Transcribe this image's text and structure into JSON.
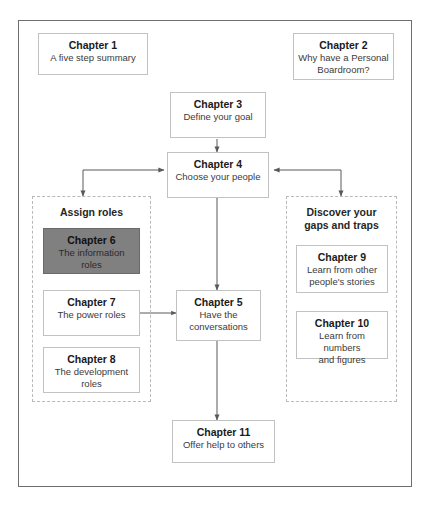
{
  "diagram": {
    "title_artifact": "",
    "groups": [
      {
        "id": "assign-roles",
        "label": "Assign roles"
      },
      {
        "id": "discover-gaps",
        "label": "Discover your\ngaps and traps"
      }
    ],
    "nodes": [
      {
        "id": "ch1",
        "title": "Chapter 1",
        "subtitle": "A five step summary"
      },
      {
        "id": "ch2",
        "title": "Chapter 2",
        "subtitle": "Why have a Personal Boardroom?"
      },
      {
        "id": "ch3",
        "title": "Chapter 3",
        "subtitle": "Define your goal"
      },
      {
        "id": "ch4",
        "title": "Chapter 4",
        "subtitle": "Choose your people"
      },
      {
        "id": "ch5",
        "title": "Chapter 5",
        "subtitle": "Have the conversations"
      },
      {
        "id": "ch6",
        "title": "Chapter 6",
        "subtitle": "The information roles"
      },
      {
        "id": "ch7",
        "title": "Chapter 7",
        "subtitle": "The power roles"
      },
      {
        "id": "ch8",
        "title": "Chapter 8",
        "subtitle": "The development roles"
      },
      {
        "id": "ch9",
        "title": "Chapter 9",
        "subtitle": "Learn from other people's stories"
      },
      {
        "id": "ch10",
        "title": "Chapter 10",
        "subtitle": "Learn from numbers and figures"
      },
      {
        "id": "ch11",
        "title": "Chapter 11",
        "subtitle": "Offer help to others"
      }
    ],
    "colors": {
      "frame_border": "#6e6e6e",
      "node_border": "#c2c2c2",
      "group_border": "#b9b9b9",
      "highlight_fill": "#808080",
      "connector": "#595959",
      "text": "#1a1a1a",
      "background": "#ffffff"
    },
    "group_titles": {
      "assign_roles": "Assign roles",
      "discover_line1": "Discover your",
      "discover_line2": "gaps and traps"
    },
    "node_text": {
      "ch1_title": "Chapter 1",
      "ch1_sub": "A five step summary",
      "ch2_title": "Chapter 2",
      "ch2_sub_l1": "Why have a Personal",
      "ch2_sub_l2": "Boardroom?",
      "ch3_title": "Chapter 3",
      "ch3_sub": "Define your goal",
      "ch4_title": "Chapter 4",
      "ch4_sub": "Choose your people",
      "ch5_title": "Chapter 5",
      "ch5_sub_l1": "Have the",
      "ch5_sub_l2": "conversations",
      "ch6_title": "Chapter 6",
      "ch6_sub_l1": "The information",
      "ch6_sub_l2": "roles",
      "ch7_title": "Chapter 7",
      "ch7_sub": "The power roles",
      "ch8_title": "Chapter 8",
      "ch8_sub_l1": "The development",
      "ch8_sub_l2": "roles",
      "ch9_title": "Chapter 9",
      "ch9_sub_l1": "Learn from other",
      "ch9_sub_l2": "people's stories",
      "ch10_title": "Chapter 10",
      "ch10_sub_l1": "Learn from numbers",
      "ch10_sub_l2": "and figures",
      "ch11_title": "Chapter 11",
      "ch11_sub": "Offer help to others"
    },
    "connections": [
      {
        "from": "ch3",
        "to": "ch4",
        "arrow": "single-down"
      },
      {
        "from": "ch4",
        "to": "assign-roles",
        "arrow": "single-down-left-elbow"
      },
      {
        "from": "assign-roles",
        "to": "ch4",
        "arrow": "single-right"
      },
      {
        "from": "ch4",
        "to": "discover-gaps",
        "arrow": "single-down-right-elbow"
      },
      {
        "from": "discover-gaps",
        "to": "ch4",
        "arrow": "single-left"
      },
      {
        "from": "ch4",
        "to": "ch5",
        "arrow": "double-vertical"
      },
      {
        "from": "ch7",
        "to": "ch5",
        "arrow": "double-horizontal"
      },
      {
        "from": "ch5",
        "to": "ch11",
        "arrow": "single-down"
      }
    ]
  }
}
